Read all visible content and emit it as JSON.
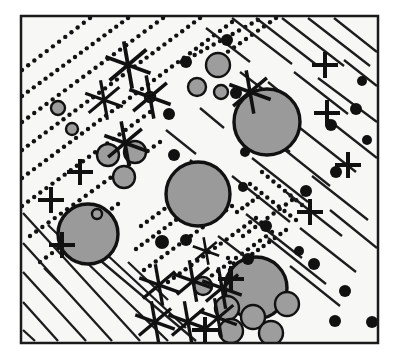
{
  "figure": {
    "width": 397,
    "height": 358,
    "background_color": "#ffffff",
    "plate_fill_color": "#f7f7f5",
    "frame": {
      "x": 21,
      "y": 16,
      "width": 357,
      "height": 327,
      "stroke_color": "#1a1a1a",
      "stroke_width": 2.5
    },
    "palette": {
      "ink": "#111111",
      "clast_fill_large": "#9a9a9a",
      "clast_fill_medium": "#9d9d9d",
      "clast_outline": "#111111",
      "dot_fill": "#111111",
      "hatch_stroke": "#1c1c1c",
      "dotted_stroke": "#111111"
    },
    "legend_note": "",
    "symbol_counts": {
      "large_clasts": 4,
      "medium_clasts": 16,
      "small_black_dots": 22,
      "six_ray_stars": 12,
      "plus_marks": 9,
      "solid_hatch_lines": 34,
      "dotted_hatch_lines": 16
    }
  },
  "chart_data": {
    "type": "scatter",
    "xlabel": "",
    "ylabel": "",
    "xlim": [
      21,
      378
    ],
    "ylim": [
      16,
      343
    ],
    "grid": false,
    "legend": "none",
    "series": [
      {
        "name": "large-clasts",
        "symbol": "filled-circle-outlined",
        "fill": "#9a9a9a",
        "stroke": "#111111",
        "stroke_width": 3.4,
        "points": [
          {
            "x": 267,
            "y": 122,
            "r": 33
          },
          {
            "x": 198,
            "y": 194,
            "r": 32
          },
          {
            "x": 88,
            "y": 234,
            "r": 30
          },
          {
            "x": 256,
            "y": 288,
            "r": 31
          }
        ]
      },
      {
        "name": "medium-clasts",
        "symbol": "filled-circle-outlined",
        "fill": "#9d9d9d",
        "stroke": "#111111",
        "stroke_width": 2.4,
        "points": [
          {
            "x": 218,
            "y": 65,
            "r": 12
          },
          {
            "x": 197,
            "y": 87,
            "r": 9
          },
          {
            "x": 221,
            "y": 92,
            "r": 7
          },
          {
            "x": 108,
            "y": 155,
            "r": 11
          },
          {
            "x": 135,
            "y": 152,
            "r": 11
          },
          {
            "x": 124,
            "y": 177,
            "r": 11
          },
          {
            "x": 58,
            "y": 108,
            "r": 7
          },
          {
            "x": 72,
            "y": 129,
            "r": 6
          },
          {
            "x": 227,
            "y": 308,
            "r": 12
          },
          {
            "x": 253,
            "y": 317,
            "r": 12
          },
          {
            "x": 287,
            "y": 304,
            "r": 12
          },
          {
            "x": 231,
            "y": 331,
            "r": 12
          },
          {
            "x": 271,
            "y": 333,
            "r": 12
          },
          {
            "x": 203,
            "y": 286,
            "r": 9
          },
          {
            "x": 150,
            "y": 97,
            "r": 5
          },
          {
            "x": 97,
            "y": 214,
            "r": 5
          }
        ]
      },
      {
        "name": "small-black-dots",
        "symbol": "filled-circle",
        "fill": "#111111",
        "points": [
          {
            "x": 186,
            "y": 62,
            "r": 6
          },
          {
            "x": 227,
            "y": 40,
            "r": 6
          },
          {
            "x": 356,
            "y": 109,
            "r": 6
          },
          {
            "x": 362,
            "y": 81,
            "r": 5
          },
          {
            "x": 336,
            "y": 172,
            "r": 6
          },
          {
            "x": 331,
            "y": 125,
            "r": 6
          },
          {
            "x": 306,
            "y": 191,
            "r": 6
          },
          {
            "x": 245,
            "y": 152,
            "r": 5
          },
          {
            "x": 236,
            "y": 93,
            "r": 6
          },
          {
            "x": 169,
            "y": 114,
            "r": 6
          },
          {
            "x": 174,
            "y": 155,
            "r": 6
          },
          {
            "x": 186,
            "y": 240,
            "r": 6
          },
          {
            "x": 162,
            "y": 242,
            "r": 7
          },
          {
            "x": 266,
            "y": 226,
            "r": 6
          },
          {
            "x": 314,
            "y": 264,
            "r": 6
          },
          {
            "x": 335,
            "y": 321,
            "r": 6
          },
          {
            "x": 372,
            "y": 322,
            "r": 6
          },
          {
            "x": 345,
            "y": 291,
            "r": 6
          },
          {
            "x": 248,
            "y": 259,
            "r": 6
          },
          {
            "x": 243,
            "y": 187,
            "r": 5
          },
          {
            "x": 367,
            "y": 140,
            "r": 5
          },
          {
            "x": 299,
            "y": 251,
            "r": 5
          }
        ]
      },
      {
        "name": "six-ray-stars",
        "symbol": "six-ray-asterisk",
        "stroke": "#111111",
        "points": [
          {
            "x": 128,
            "y": 65,
            "r": 24
          },
          {
            "x": 104,
            "y": 100,
            "r": 20
          },
          {
            "x": 150,
            "y": 97,
            "r": 22
          },
          {
            "x": 125,
            "y": 143,
            "r": 22
          },
          {
            "x": 250,
            "y": 92,
            "r": 22
          },
          {
            "x": 159,
            "y": 285,
            "r": 21
          },
          {
            "x": 193,
            "y": 281,
            "r": 21
          },
          {
            "x": 222,
            "y": 288,
            "r": 21
          },
          {
            "x": 155,
            "y": 322,
            "r": 21
          },
          {
            "x": 188,
            "y": 322,
            "r": 21
          },
          {
            "x": 218,
            "y": 318,
            "r": 20
          },
          {
            "x": 206,
            "y": 251,
            "r": 14
          }
        ]
      },
      {
        "name": "plus-marks",
        "symbol": "plus",
        "stroke": "#111111",
        "stroke_width": 4,
        "points": [
          {
            "x": 80,
            "y": 172,
            "r": 13
          },
          {
            "x": 51,
            "y": 200,
            "r": 13
          },
          {
            "x": 62,
            "y": 245,
            "r": 13
          },
          {
            "x": 325,
            "y": 65,
            "r": 13
          },
          {
            "x": 327,
            "y": 113,
            "r": 13
          },
          {
            "x": 348,
            "y": 165,
            "r": 13
          },
          {
            "x": 310,
            "y": 212,
            "r": 13
          },
          {
            "x": 231,
            "y": 279,
            "r": 13
          },
          {
            "x": 205,
            "y": 330,
            "r": 13
          }
        ]
      }
    ],
    "hatch_groups": [
      {
        "name": "dotted-hatch-upper-left",
        "style": "dotted",
        "stroke": "#111111",
        "dot_radius": 2.2,
        "spacing": 7.5,
        "lines": [
          {
            "x1": 22,
            "y1": 70,
            "x2": 90,
            "y2": 18
          },
          {
            "x1": 22,
            "y1": 96,
            "x2": 128,
            "y2": 18
          },
          {
            "x1": 22,
            "y1": 122,
            "x2": 163,
            "y2": 18
          },
          {
            "x1": 22,
            "y1": 150,
            "x2": 200,
            "y2": 18
          },
          {
            "x1": 22,
            "y1": 178,
            "x2": 232,
            "y2": 22
          },
          {
            "x1": 22,
            "y1": 206,
            "x2": 150,
            "y2": 112
          },
          {
            "x1": 30,
            "y1": 236,
            "x2": 160,
            "y2": 142
          },
          {
            "x1": 40,
            "y1": 262,
            "x2": 118,
            "y2": 204
          },
          {
            "x1": 182,
            "y1": 62,
            "x2": 258,
            "y2": 20
          },
          {
            "x1": 216,
            "y1": 60,
            "x2": 276,
            "y2": 18
          }
        ]
      },
      {
        "name": "dotted-hatch-center",
        "style": "dotted",
        "stroke": "#111111",
        "dot_radius": 2.2,
        "spacing": 7.2,
        "lines": [
          {
            "x1": 141,
            "y1": 226,
            "x2": 182,
            "y2": 196
          },
          {
            "x1": 136,
            "y1": 249,
            "x2": 199,
            "y2": 203
          },
          {
            "x1": 144,
            "y1": 270,
            "x2": 232,
            "y2": 206
          },
          {
            "x1": 168,
            "y1": 282,
            "x2": 256,
            "y2": 218
          },
          {
            "x1": 200,
            "y1": 284,
            "x2": 272,
            "y2": 232
          },
          {
            "x1": 230,
            "y1": 270,
            "x2": 286,
            "y2": 230
          },
          {
            "x1": 243,
            "y1": 236,
            "x2": 292,
            "y2": 200
          },
          {
            "x1": 237,
            "y1": 212,
            "x2": 258,
            "y2": 197
          },
          {
            "x1": 262,
            "y1": 172,
            "x2": 302,
            "y2": 205
          },
          {
            "x1": 250,
            "y1": 184,
            "x2": 296,
            "y2": 220
          },
          {
            "x1": 228,
            "y1": 258,
            "x2": 262,
            "y2": 290
          }
        ]
      },
      {
        "name": "solid-hatch-upper-right",
        "style": "solid",
        "stroke": "#1c1c1c",
        "stroke_width": 2.3,
        "lines": [
          {
            "x1": 232,
            "y1": 18,
            "x2": 292,
            "y2": 64
          },
          {
            "x1": 256,
            "y1": 18,
            "x2": 318,
            "y2": 66
          },
          {
            "x1": 282,
            "y1": 18,
            "x2": 344,
            "y2": 66
          },
          {
            "x1": 308,
            "y1": 18,
            "x2": 370,
            "y2": 66
          },
          {
            "x1": 334,
            "y1": 18,
            "x2": 377,
            "y2": 52
          },
          {
            "x1": 206,
            "y1": 28,
            "x2": 250,
            "y2": 62
          },
          {
            "x1": 294,
            "y1": 72,
            "x2": 348,
            "y2": 114
          },
          {
            "x1": 318,
            "y1": 78,
            "x2": 377,
            "y2": 122
          },
          {
            "x1": 268,
            "y1": 82,
            "x2": 290,
            "y2": 100
          },
          {
            "x1": 344,
            "y1": 60,
            "x2": 377,
            "y2": 86
          },
          {
            "x1": 240,
            "y1": 72,
            "x2": 264,
            "y2": 90
          },
          {
            "x1": 300,
            "y1": 128,
            "x2": 356,
            "y2": 172
          },
          {
            "x1": 280,
            "y1": 146,
            "x2": 330,
            "y2": 186
          },
          {
            "x1": 326,
            "y1": 118,
            "x2": 377,
            "y2": 158
          },
          {
            "x1": 252,
            "y1": 158,
            "x2": 308,
            "y2": 202
          },
          {
            "x1": 262,
            "y1": 130,
            "x2": 290,
            "y2": 152
          },
          {
            "x1": 232,
            "y1": 176,
            "x2": 290,
            "y2": 222
          },
          {
            "x1": 286,
            "y1": 192,
            "x2": 342,
            "y2": 236
          },
          {
            "x1": 312,
            "y1": 176,
            "x2": 368,
            "y2": 220
          },
          {
            "x1": 246,
            "y1": 214,
            "x2": 302,
            "y2": 258
          },
          {
            "x1": 268,
            "y1": 238,
            "x2": 326,
            "y2": 284
          },
          {
            "x1": 300,
            "y1": 228,
            "x2": 356,
            "y2": 272
          },
          {
            "x1": 330,
            "y1": 210,
            "x2": 377,
            "y2": 248
          },
          {
            "x1": 290,
            "y1": 266,
            "x2": 340,
            "y2": 306
          },
          {
            "x1": 218,
            "y1": 236,
            "x2": 252,
            "y2": 262
          },
          {
            "x1": 200,
            "y1": 108,
            "x2": 224,
            "y2": 128
          },
          {
            "x1": 166,
            "y1": 130,
            "x2": 196,
            "y2": 154
          },
          {
            "x1": 190,
            "y1": 160,
            "x2": 216,
            "y2": 182
          }
        ]
      },
      {
        "name": "solid-hatch-lower-left",
        "style": "solid",
        "stroke": "#1c1c1c",
        "stroke_width": 2.3,
        "lines": [
          {
            "x1": 23,
            "y1": 213,
            "x2": 140,
            "y2": 341
          },
          {
            "x1": 23,
            "y1": 243,
            "x2": 112,
            "y2": 341
          },
          {
            "x1": 23,
            "y1": 272,
            "x2": 86,
            "y2": 341
          },
          {
            "x1": 23,
            "y1": 302,
            "x2": 58,
            "y2": 341
          },
          {
            "x1": 48,
            "y1": 225,
            "x2": 168,
            "y2": 341
          },
          {
            "x1": 76,
            "y1": 240,
            "x2": 196,
            "y2": 341
          },
          {
            "x1": 104,
            "y1": 252,
            "x2": 186,
            "y2": 328
          },
          {
            "x1": 128,
            "y1": 262,
            "x2": 168,
            "y2": 300
          },
          {
            "x1": 23,
            "y1": 330,
            "x2": 35,
            "y2": 341
          },
          {
            "x1": 44,
            "y1": 268,
            "x2": 60,
            "y2": 284
          }
        ]
      }
    ],
    "annotations": []
  },
  "accessibility": {
    "alt": "Square bordered plate showing a sedimentary fabric: dotted diagonal hatching in the upper left, solid diagonal hatching in the upper right and lower left, six-ray star symbols, plus marks, small black dots and gray outlined clasts of varying size."
  }
}
